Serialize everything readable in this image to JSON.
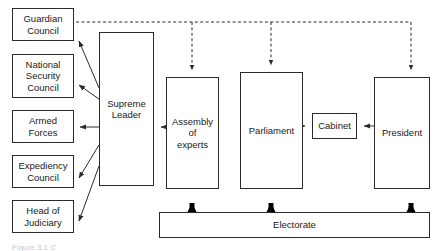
{
  "diagram": {
    "nodes": {
      "guardian_council": "Guardian\nCouncil",
      "national_security_council": "National\nSecurity\nCouncil",
      "armed_forces": "Armed\nForces",
      "expediency_council": "Expediency\nCouncil",
      "head_of_judiciary": "Head of\nJudiciary",
      "supreme_leader": "Supreme\nLeader",
      "assembly_of_experts": "Assembly\nof\nexperts",
      "parliament": "Parliament",
      "cabinet": "Cabinet",
      "president": "President",
      "electorate": "Electorate"
    },
    "caption": "Figure 3.1 C",
    "colors": {
      "stroke": "#2b2b2b",
      "fill": "#ffffff",
      "text": "#1a1a1a",
      "thick_arrow": "#000000"
    },
    "edges": [
      {
        "name": "supreme-leader-to-guardian-council",
        "from": "supreme_leader",
        "to": "guardian_council",
        "style": "solid",
        "weight": "thin"
      },
      {
        "name": "supreme-leader-to-national-security-council",
        "from": "supreme_leader",
        "to": "national_security_council",
        "style": "solid",
        "weight": "thin"
      },
      {
        "name": "supreme-leader-to-armed-forces",
        "from": "supreme_leader",
        "to": "armed_forces",
        "style": "solid",
        "weight": "thin"
      },
      {
        "name": "supreme-leader-to-expediency-council",
        "from": "supreme_leader",
        "to": "expediency_council",
        "style": "solid",
        "weight": "thin"
      },
      {
        "name": "supreme-leader-to-head-of-judiciary",
        "from": "supreme_leader",
        "to": "head_of_judiciary",
        "style": "solid",
        "weight": "thin"
      },
      {
        "name": "assembly-of-experts-to-supreme-leader",
        "from": "assembly_of_experts",
        "to": "supreme_leader",
        "style": "solid",
        "weight": "thin"
      },
      {
        "name": "parliament-to-cabinet",
        "from": "parliament",
        "to": "cabinet",
        "style": "dashed",
        "weight": "thin"
      },
      {
        "name": "president-to-cabinet",
        "from": "president",
        "to": "cabinet",
        "style": "solid",
        "weight": "thin"
      },
      {
        "name": "guardian-council-to-assembly-of-experts",
        "from": "guardian_council",
        "to": "assembly_of_experts",
        "style": "dashed",
        "weight": "thin"
      },
      {
        "name": "guardian-council-to-parliament",
        "from": "guardian_council",
        "to": "parliament",
        "style": "dashed",
        "weight": "thin"
      },
      {
        "name": "guardian-council-to-president",
        "from": "guardian_council",
        "to": "president",
        "style": "dashed",
        "weight": "thin"
      },
      {
        "name": "electorate-to-assembly-of-experts",
        "from": "electorate",
        "to": "assembly_of_experts",
        "style": "solid",
        "weight": "thick"
      },
      {
        "name": "electorate-to-parliament",
        "from": "electorate",
        "to": "parliament",
        "style": "solid",
        "weight": "thick"
      },
      {
        "name": "electorate-to-president",
        "from": "electorate",
        "to": "president",
        "style": "solid",
        "weight": "thick"
      }
    ]
  }
}
